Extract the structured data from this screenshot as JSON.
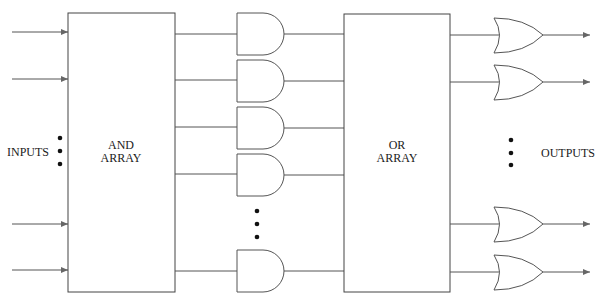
{
  "diagram": {
    "type": "PLA block diagram",
    "labels": {
      "inputs": "INPUTS",
      "and_array_line1": "AND",
      "and_array_line2": "ARRAY",
      "or_array_line1": "OR",
      "or_array_line2": "ARRAY",
      "outputs": "OUTPUTS"
    },
    "input_lines_y": [
      32,
      79,
      224,
      270
    ],
    "and_gates_y": [
      34,
      80,
      127,
      174,
      270
    ],
    "or_gates_y": [
      35,
      82,
      224,
      272
    ],
    "ellipsis_groups": [
      "inputs",
      "and-gates",
      "outputs"
    ],
    "colors": {
      "line": "#555555",
      "text": "#1a1a1a",
      "dot": "#111111"
    }
  }
}
